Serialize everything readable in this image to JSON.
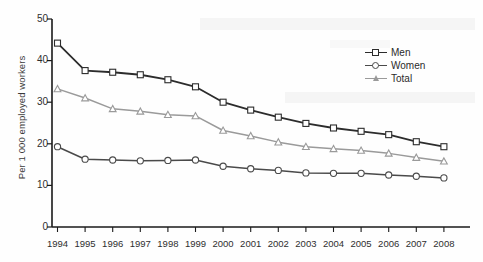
{
  "chart_data": {
    "type": "line",
    "title": "",
    "xlabel": "",
    "ylabel": "Per 1 000 employed workers",
    "categories": [
      "1994",
      "1995",
      "1996",
      "1997",
      "1998",
      "1999",
      "2000",
      "2001",
      "2002",
      "2003",
      "2004",
      "2005",
      "2006",
      "2007",
      "2008"
    ],
    "ylim": [
      0,
      50
    ],
    "yticks": [
      0,
      10,
      20,
      30,
      40,
      50
    ],
    "grid": false,
    "legend_position": "top-right",
    "series": [
      {
        "name": "Men",
        "marker": "square",
        "color": "#2c2c2c",
        "values": [
          44.2,
          37.6,
          37.2,
          36.6,
          35.4,
          33.7,
          30.0,
          28.1,
          26.4,
          24.9,
          23.8,
          23.0,
          22.2,
          20.5,
          19.3
        ]
      },
      {
        "name": "Women",
        "marker": "circle",
        "color": "#4a4a4a",
        "values": [
          19.3,
          16.3,
          16.1,
          15.9,
          16.0,
          16.1,
          14.6,
          14.0,
          13.6,
          13.0,
          12.9,
          12.9,
          12.5,
          12.2,
          11.8
        ]
      },
      {
        "name": "Total",
        "marker": "triangle",
        "color": "#9a9a9a",
        "values": [
          33.2,
          31.0,
          28.4,
          27.8,
          27.0,
          26.7,
          23.2,
          21.9,
          20.4,
          19.3,
          18.8,
          18.4,
          17.7,
          16.7,
          15.8
        ]
      }
    ]
  },
  "legend": {
    "items": [
      {
        "label": "Men"
      },
      {
        "label": "Women"
      },
      {
        "label": "Total"
      }
    ]
  },
  "axes": {
    "y_title": "Per 1 000 employed workers",
    "y_tick_labels": [
      "50",
      "40",
      "30",
      "20",
      "10",
      "0"
    ],
    "x_tick_labels": [
      "1994",
      "1995",
      "1996",
      "1997",
      "1998",
      "1999",
      "2000",
      "2001",
      "2002",
      "2003",
      "2004",
      "2005",
      "2006",
      "2007",
      "2008"
    ]
  },
  "colors": {
    "men": "#2c2c2c",
    "women": "#4a4a4a",
    "total": "#9a9a9a",
    "axis": "#1a1a1a",
    "background": "#fefefe"
  }
}
